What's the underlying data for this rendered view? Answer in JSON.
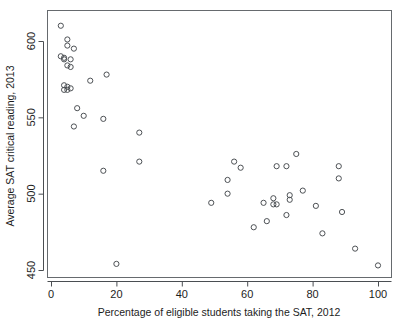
{
  "chart_data": {
    "type": "scatter",
    "title": "",
    "xlabel": "Percentage of eligible students taking the SAT, 2012",
    "ylabel": "Average SAT critical reading, 2013",
    "xlim": [
      -2,
      104
    ],
    "ylim": [
      444,
      614
    ],
    "xticks": [
      0,
      20,
      40,
      60,
      80,
      100
    ],
    "yticks": [
      450,
      500,
      550,
      600
    ],
    "grid": false,
    "legend": null,
    "marker": "open-circle",
    "marker_color": "#4d5155",
    "points": [
      {
        "x": 3,
        "y": 610
      },
      {
        "x": 5,
        "y": 601
      },
      {
        "x": 5,
        "y": 597
      },
      {
        "x": 7,
        "y": 595
      },
      {
        "x": 3,
        "y": 590
      },
      {
        "x": 4,
        "y": 589
      },
      {
        "x": 4,
        "y": 588
      },
      {
        "x": 6,
        "y": 588
      },
      {
        "x": 5,
        "y": 584
      },
      {
        "x": 6,
        "y": 583
      },
      {
        "x": 12,
        "y": 574
      },
      {
        "x": 17,
        "y": 578
      },
      {
        "x": 4,
        "y": 571
      },
      {
        "x": 5,
        "y": 570
      },
      {
        "x": 4,
        "y": 568
      },
      {
        "x": 5,
        "y": 568
      },
      {
        "x": 6,
        "y": 569
      },
      {
        "x": 8,
        "y": 556
      },
      {
        "x": 10,
        "y": 551
      },
      {
        "x": 16,
        "y": 549
      },
      {
        "x": 7,
        "y": 544
      },
      {
        "x": 27,
        "y": 540
      },
      {
        "x": 27,
        "y": 521
      },
      {
        "x": 16,
        "y": 515
      },
      {
        "x": 20,
        "y": 454
      },
      {
        "x": 49,
        "y": 494
      },
      {
        "x": 54,
        "y": 509
      },
      {
        "x": 54,
        "y": 500
      },
      {
        "x": 56,
        "y": 521
      },
      {
        "x": 58,
        "y": 517
      },
      {
        "x": 62,
        "y": 478
      },
      {
        "x": 65,
        "y": 494
      },
      {
        "x": 66,
        "y": 482
      },
      {
        "x": 68,
        "y": 497
      },
      {
        "x": 68,
        "y": 493
      },
      {
        "x": 69,
        "y": 493
      },
      {
        "x": 69,
        "y": 518
      },
      {
        "x": 72,
        "y": 518
      },
      {
        "x": 72,
        "y": 486
      },
      {
        "x": 73,
        "y": 499
      },
      {
        "x": 73,
        "y": 496
      },
      {
        "x": 75,
        "y": 526
      },
      {
        "x": 77,
        "y": 502
      },
      {
        "x": 81,
        "y": 492
      },
      {
        "x": 83,
        "y": 474
      },
      {
        "x": 88,
        "y": 518
      },
      {
        "x": 88,
        "y": 510
      },
      {
        "x": 89,
        "y": 488
      },
      {
        "x": 93,
        "y": 464
      },
      {
        "x": 100,
        "y": 453
      }
    ]
  },
  "axes": {
    "x_tick_labels": [
      "0",
      "20",
      "40",
      "60",
      "80",
      "100"
    ],
    "y_tick_labels": [
      "450",
      "500",
      "550",
      "600"
    ],
    "x_title": "Percentage of eligible students taking the SAT, 2012",
    "y_title": "Average SAT critical reading, 2013"
  }
}
